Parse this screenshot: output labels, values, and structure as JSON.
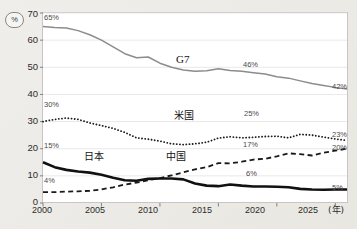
{
  "chart_data": {
    "type": "line",
    "title": "",
    "xlabel": "年",
    "ylabel": "%",
    "xlim": [
      2000,
      2026
    ],
    "ylim": [
      0,
      70
    ],
    "yticks": [
      0,
      10,
      20,
      30,
      40,
      50,
      60,
      70
    ],
    "xticks": [
      2000,
      2005,
      2010,
      2015,
      2020,
      2025
    ],
    "grid": true,
    "legend_position": "inline-annotation",
    "x": [
      2000,
      2001,
      2002,
      2003,
      2004,
      2005,
      2006,
      2007,
      2008,
      2009,
      2010,
      2011,
      2012,
      2013,
      2014,
      2015,
      2016,
      2017,
      2018,
      2019,
      2020,
      2021,
      2022,
      2023,
      2024,
      2025,
      2026
    ],
    "series": [
      {
        "name": "G7",
        "style": "solid-thin-gray",
        "color": "#8c8c8c",
        "values": [
          65,
          64.7,
          64.5,
          63.5,
          62.0,
          60.0,
          57.5,
          55.0,
          53.5,
          53.8,
          51.5,
          50.0,
          49.0,
          48.5,
          48.7,
          49.5,
          48.8,
          48.5,
          48.0,
          47.5,
          46.5,
          46.0,
          45.0,
          44.0,
          43.3,
          42.6,
          42.0
        ]
      },
      {
        "name": "米国",
        "style": "dotted-black",
        "color": "#1a1a1a",
        "values": [
          30.0,
          30.8,
          31.3,
          30.8,
          29.5,
          28.5,
          27.5,
          26.0,
          24.0,
          23.5,
          22.8,
          21.8,
          21.5,
          21.8,
          22.4,
          23.9,
          24.4,
          24.0,
          24.2,
          24.5,
          24.6,
          24.0,
          25.3,
          25.0,
          24.3,
          23.6,
          23.0
        ]
      },
      {
        "name": "中国",
        "style": "dashed-black",
        "color": "#1a1a1a",
        "values": [
          4.0,
          4.0,
          4.2,
          4.3,
          4.5,
          5.0,
          5.8,
          6.8,
          7.5,
          8.4,
          9.2,
          10.2,
          11.3,
          12.4,
          13.2,
          14.7,
          14.6,
          15.2,
          16.0,
          16.3,
          17.2,
          18.3,
          18.0,
          17.5,
          18.5,
          19.3,
          20.0
        ]
      },
      {
        "name": "日本",
        "style": "solid-thick-black",
        "color": "#111111",
        "values": [
          15.0,
          13.2,
          12.2,
          11.6,
          11.2,
          10.4,
          9.3,
          8.4,
          8.2,
          8.9,
          9.0,
          9.0,
          8.7,
          7.2,
          6.4,
          6.2,
          6.8,
          6.4,
          6.1,
          6.1,
          6.0,
          5.8,
          5.2,
          5.0,
          4.9,
          5.0,
          5.0
        ]
      }
    ],
    "annotations": [
      {
        "name": "g7-start-value",
        "text": "65%",
        "x": 2000,
        "y": 65,
        "place": "above-left"
      },
      {
        "name": "g7-mid-value",
        "text": "46%",
        "x": 2020,
        "y": 46,
        "place": "above"
      },
      {
        "name": "g7-end-value",
        "text": "42%",
        "x": 2026,
        "y": 42,
        "place": "right"
      },
      {
        "name": "us-start-value",
        "text": "30%",
        "x": 2000,
        "y": 30,
        "place": "above-left"
      },
      {
        "name": "us-mid-value",
        "text": "25%",
        "x": 2020,
        "y": 25,
        "place": "above"
      },
      {
        "name": "us-end-value",
        "text": "23%",
        "x": 2026,
        "y": 23,
        "place": "right"
      },
      {
        "name": "japan-start-value",
        "text": "15%",
        "x": 2000,
        "y": 15,
        "place": "above-left"
      },
      {
        "name": "japan-mid-value",
        "text": "6%",
        "x": 2020,
        "y": 6,
        "place": "above"
      },
      {
        "name": "japan-end-value",
        "text": "5%",
        "x": 2026,
        "y": 5,
        "place": "right"
      },
      {
        "name": "china-start-value",
        "text": "4%",
        "x": 2000,
        "y": 4,
        "place": "above-left"
      },
      {
        "name": "china-mid-value",
        "text": "17%",
        "x": 2020,
        "y": 17,
        "place": "above"
      },
      {
        "name": "china-end-value",
        "text": "20%",
        "x": 2026,
        "y": 20,
        "place": "right"
      }
    ]
  },
  "axis": {
    "y_unit_badge": "%",
    "y_tick_labels": [
      "70",
      "60",
      "50",
      "40",
      "30",
      "20",
      "10",
      "0"
    ],
    "x_tick_labels": [
      "2000",
      "2005",
      "2010",
      "2015",
      "2020",
      "2025"
    ],
    "x_unit_label": "(年)"
  },
  "series_labels": {
    "g7": "G7",
    "us": "米国",
    "china": "中国",
    "japan": "日本"
  },
  "value_labels": {
    "g7_start": "65%",
    "g7_mid": "46%",
    "g7_end": "42%",
    "us_start": "30%",
    "us_mid": "25%",
    "us_end": "23%",
    "japan_start": "15%",
    "japan_mid": "6%",
    "japan_end": "5%",
    "china_start": "4%",
    "china_mid": "17%",
    "china_end": "20%"
  },
  "colors": {
    "g7_line": "#8c8c8c",
    "mono_line": "#1a1a1a",
    "grid": "#e2e2e2",
    "frame": "#c8c6c2",
    "page_bg": "#eceae6",
    "plot_bg": "#ffffff"
  }
}
